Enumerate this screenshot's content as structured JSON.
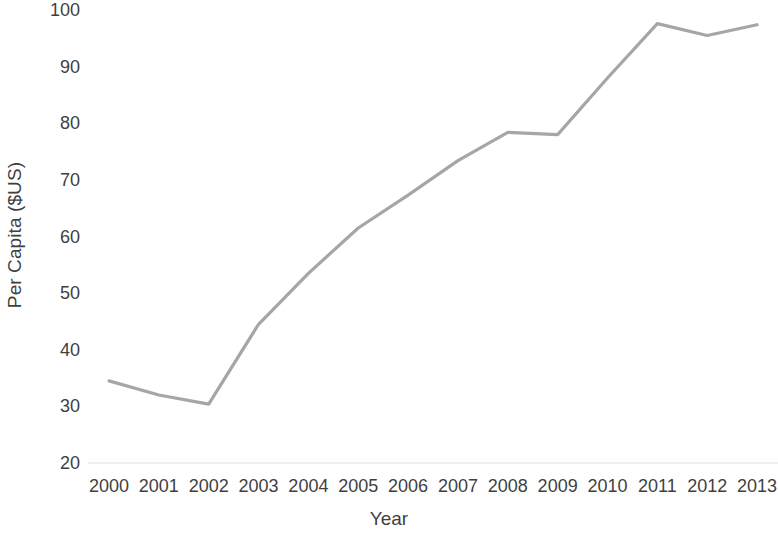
{
  "chart_data": {
    "type": "line",
    "title": "",
    "xlabel": "Year",
    "ylabel": "Per Capita ($US)",
    "categories": [
      "2000",
      "2001",
      "2002",
      "2003",
      "2004",
      "2005",
      "2006",
      "2007",
      "2008",
      "2009",
      "2010",
      "2011",
      "2012",
      "2013"
    ],
    "values": [
      34.5,
      32.0,
      30.4,
      44.5,
      53.5,
      61.5,
      67.3,
      73.4,
      78.4,
      78.0,
      88.0,
      97.6,
      95.5,
      97.4
    ],
    "series": [
      {
        "name": "Per Capita ($US)",
        "color": "#a6a6a6",
        "values": [
          34.5,
          32.0,
          30.4,
          44.5,
          53.5,
          61.5,
          67.3,
          73.4,
          78.4,
          78.0,
          88.0,
          97.6,
          95.5,
          97.4
        ]
      }
    ],
    "ylim": [
      20,
      100
    ],
    "yticks": [
      20,
      30,
      40,
      50,
      60,
      70,
      80,
      90,
      100
    ],
    "ytick_labels": [
      "20",
      "30",
      "40",
      "50",
      "60",
      "70",
      "80",
      "90",
      "100"
    ],
    "xtick_labels": [
      "2000",
      "2001",
      "2002",
      "2003",
      "2004",
      "2005",
      "2006",
      "2007",
      "2008",
      "2009",
      "2010",
      "2011",
      "2012",
      "2013"
    ],
    "grid": false,
    "legend": "none",
    "line_width": 3,
    "marker": "none",
    "baseline_color": "#e8e8e8",
    "axis_text_color": "#3f3f3f"
  }
}
